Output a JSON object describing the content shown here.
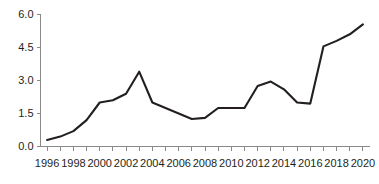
{
  "chart_data": {
    "type": "line",
    "title": "",
    "subtitle": "",
    "xlabel": "",
    "ylabel": "",
    "xlim": [
      1995.5,
      2020.5
    ],
    "ylim": [
      0.0,
      6.0
    ],
    "grid": false,
    "legend": null,
    "legend_position": "none",
    "line_color": "#231f20",
    "axis_color": "#8a8a8a",
    "tick_label_color": "#231f20",
    "background_color": "#ffffff",
    "y_ticks": [
      "0.0",
      "1.5",
      "3.0",
      "4.5",
      "6.0"
    ],
    "y_tick_values": [
      0.0,
      1.5,
      3.0,
      4.5,
      6.0
    ],
    "x_ticks": [
      "1996",
      "1998",
      "2000",
      "2002",
      "2004",
      "2006",
      "2008",
      "2010",
      "2012",
      "2014",
      "2016",
      "2018",
      "2020"
    ],
    "x_tick_values": [
      1996,
      1998,
      2000,
      2002,
      2004,
      2006,
      2008,
      2010,
      2012,
      2014,
      2016,
      2018,
      2020
    ],
    "x_minor_tick_values": [
      1996,
      1997,
      1998,
      1999,
      2000,
      2001,
      2002,
      2003,
      2004,
      2005,
      2006,
      2007,
      2008,
      2009,
      2010,
      2011,
      2012,
      2013,
      2014,
      2015,
      2016,
      2017,
      2018,
      2019,
      2020
    ],
    "categories": [
      1996,
      1997,
      1998,
      1999,
      2000,
      2001,
      2002,
      2003,
      2004,
      2005,
      2006,
      2007,
      2008,
      2009,
      2010,
      2011,
      2012,
      2013,
      2014,
      2015,
      2016,
      2017,
      2018,
      2019,
      2020
    ],
    "values": [
      0.3,
      0.45,
      0.7,
      1.2,
      2.0,
      2.1,
      2.4,
      3.4,
      2.0,
      1.75,
      1.5,
      1.25,
      1.3,
      1.75,
      1.75,
      1.75,
      2.75,
      2.95,
      2.6,
      2.0,
      1.95,
      4.55,
      4.8,
      5.1,
      5.55
    ],
    "series": [
      {
        "name": "series-1",
        "values": [
          0.3,
          0.45,
          0.7,
          1.2,
          2.0,
          2.1,
          2.4,
          3.4,
          2.0,
          1.75,
          1.5,
          1.25,
          1.3,
          1.75,
          1.75,
          1.75,
          2.75,
          2.95,
          2.6,
          2.0,
          1.95,
          4.55,
          4.8,
          5.1,
          5.55
        ]
      }
    ]
  }
}
